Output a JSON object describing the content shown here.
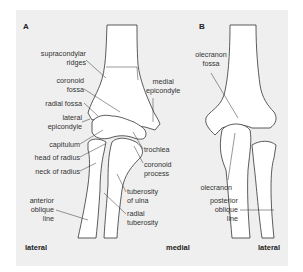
{
  "figure": {
    "panels": [
      {
        "id": "A",
        "label": "A",
        "view": "anterior elbow"
      },
      {
        "id": "B",
        "label": "B",
        "view": "posterior elbow"
      }
    ],
    "panel_a_labels": {
      "supracondylar_ridges": [
        "supracondylar",
        "ridges"
      ],
      "coronoid_fossa": [
        "coronoid",
        "fossa"
      ],
      "radial_fossa": "radial fossa",
      "lateral_epicondyle": [
        "lateral",
        "epicondyle"
      ],
      "capitulum": "capitulum",
      "head_of_radius": "head of radius",
      "neck_of_radius": "neck of radius",
      "anterior_oblique_line": [
        "anterior",
        "oblique",
        "line"
      ],
      "medial_epicondyle": [
        "medial",
        "epicondyle"
      ],
      "trochlea": "trochlea",
      "coronoid_process": [
        "coronoid",
        "process"
      ],
      "tuberosity_of_ulna": [
        "tuberosity",
        "of ulna"
      ],
      "radial_tuberosity": [
        "radial",
        "tuberosity"
      ]
    },
    "panel_b_labels": {
      "olecranon_fossa": [
        "olecranon",
        "fossa"
      ],
      "olecranon": "olecranon",
      "posterior_oblique_line": [
        "posterior",
        "oblique",
        "line"
      ]
    },
    "orientation": {
      "a_left": "lateral",
      "a_right": "medial",
      "b_right": "lateral"
    },
    "colors": {
      "background": "#efefef",
      "bone_fill": "#ffffff",
      "outline": "#333333",
      "text": "#333333"
    }
  }
}
